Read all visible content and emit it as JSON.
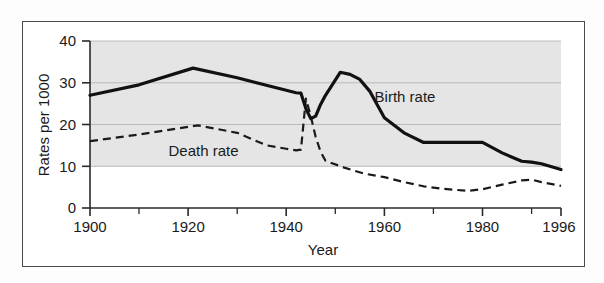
{
  "figure": {
    "background_color": "#fdfdfd",
    "frame_color": "#4a4a4a"
  },
  "chart_data": {
    "type": "line",
    "title": "",
    "xlabel": "Year",
    "ylabel": "Rates per 1000",
    "xlim": [
      1900,
      1996
    ],
    "ylim": [
      0,
      40
    ],
    "xticks": [
      1900,
      1920,
      1940,
      1960,
      1980,
      1996
    ],
    "xtick_labels": [
      "1900",
      "1920",
      "1940",
      "1960",
      "1980",
      "1996"
    ],
    "xminorticks": [
      1910,
      1930,
      1950,
      1970,
      1990
    ],
    "yticks": [
      0,
      10,
      20,
      30,
      40
    ],
    "ytick_labels": [
      "0",
      "10",
      "20",
      "30",
      "40"
    ],
    "grid": "horizontal gridlines at 10, 20, 30, 40",
    "plot_band": {
      "from": 10,
      "to": 40,
      "color": "#e2e2e2",
      "note": "light grey shaded band above value 10"
    },
    "legend_position": "inline annotations on curves",
    "series": [
      {
        "name": "Birth rate",
        "style": "solid",
        "color": "#111111",
        "line_width": 3.2,
        "label_text": "Birth rate",
        "x": [
          1900,
          1910,
          1921,
          1930,
          1942,
          1943,
          1944,
          1945,
          1946,
          1947,
          1948,
          1951,
          1953,
          1955,
          1957,
          1960,
          1964,
          1968,
          1972,
          1976,
          1980,
          1984,
          1988,
          1990,
          1992,
          1996
        ],
        "y": [
          27.0,
          29.5,
          33.5,
          31.2,
          27.6,
          27.5,
          23.8,
          21.4,
          22.0,
          24.8,
          27.0,
          32.5,
          32.0,
          30.8,
          28.0,
          21.6,
          18.0,
          15.7,
          15.7,
          15.7,
          15.7,
          13.2,
          11.2,
          11.0,
          10.6,
          9.2
        ]
      },
      {
        "name": "Death rate",
        "style": "dashed",
        "color": "#1a1a1a",
        "line_width": 2.2,
        "label_text": "Death rate",
        "x": [
          1900,
          1910,
          1922,
          1930,
          1936,
          1940,
          1942,
          1943,
          1944,
          1945,
          1946,
          1947,
          1948,
          1952,
          1956,
          1960,
          1964,
          1968,
          1972,
          1977,
          1980,
          1984,
          1988,
          1990,
          1992,
          1996
        ],
        "y": [
          16.0,
          17.6,
          19.8,
          18.0,
          15.0,
          14.2,
          13.8,
          14.0,
          26.2,
          22.0,
          17.0,
          13.5,
          11.3,
          9.6,
          8.2,
          7.4,
          6.2,
          5.2,
          4.6,
          4.1,
          4.5,
          5.6,
          6.6,
          6.8,
          6.2,
          5.3
        ]
      }
    ],
    "annotations": [
      {
        "text": "Birth rate",
        "x": 1958,
        "y": 25.5
      },
      {
        "text": "Death rate",
        "x": 1916,
        "y": 12.5
      }
    ]
  },
  "caption": {
    "strip_text": "",
    "visible": false
  }
}
